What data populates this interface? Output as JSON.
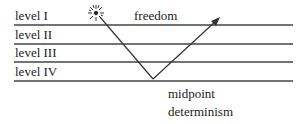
{
  "levels": [
    {
      "label": "level I",
      "y": 25
    },
    {
      "label": "level II",
      "y": 44
    },
    {
      "label": "level III",
      "y": 62
    },
    {
      "label": "level IV",
      "y": 81
    }
  ],
  "annotations": {
    "top": "freedom",
    "bottom_line1": "midpoint",
    "bottom_line2": "determinism"
  },
  "colors": {
    "line": "#444444",
    "text": "#222222"
  }
}
